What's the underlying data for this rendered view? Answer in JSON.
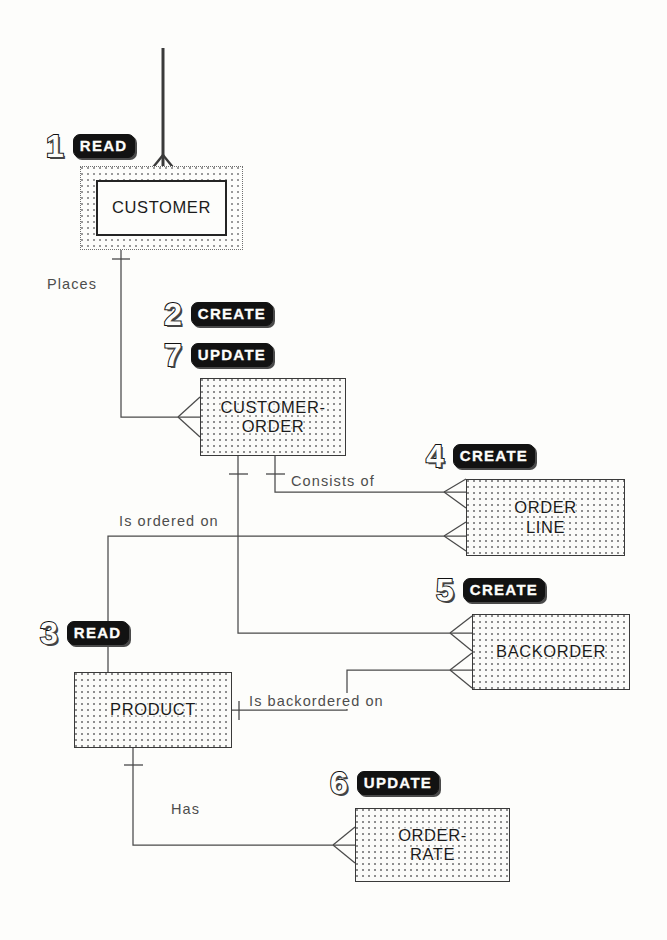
{
  "diagram": {
    "entities": [
      {
        "id": "customer",
        "label": "CUSTOMER",
        "x": 96,
        "y": 180,
        "w": 131,
        "h": 56
      },
      {
        "id": "customer-order",
        "label": "CUSTOMER-\nORDER",
        "x": 200,
        "y": 378,
        "w": 146,
        "h": 78
      },
      {
        "id": "order-line",
        "label": "ORDER\nLINE",
        "x": 466,
        "y": 479,
        "w": 159,
        "h": 77
      },
      {
        "id": "backorder",
        "label": "BACKORDER",
        "x": 472,
        "y": 614,
        "w": 158,
        "h": 76
      },
      {
        "id": "product",
        "label": "PRODUCT",
        "x": 74,
        "y": 672,
        "w": 158,
        "h": 76
      },
      {
        "id": "order-rate",
        "label": "ORDER-\nRATE",
        "x": 355,
        "y": 808,
        "w": 155,
        "h": 74
      }
    ],
    "steps": [
      {
        "id": "step-1",
        "number": "1",
        "action": "READ",
        "x": 46,
        "y": 130
      },
      {
        "id": "step-2",
        "number": "2",
        "action": "CREATE",
        "x": 164,
        "y": 298
      },
      {
        "id": "step-7",
        "number": "7",
        "action": "UPDATE",
        "x": 164,
        "y": 339
      },
      {
        "id": "step-4",
        "number": "4",
        "action": "CREATE",
        "x": 426,
        "y": 440
      },
      {
        "id": "step-5",
        "number": "5",
        "action": "CREATE",
        "x": 436,
        "y": 574
      },
      {
        "id": "step-3",
        "number": "3",
        "action": "READ",
        "x": 40,
        "y": 617
      },
      {
        "id": "step-6",
        "number": "6",
        "action": "UPDATE",
        "x": 330,
        "y": 767
      }
    ],
    "relationships": [
      {
        "id": "rel-places",
        "label": "Places",
        "x": 44,
        "y": 276
      },
      {
        "id": "rel-consists-of",
        "label": "Consists of",
        "x": 288,
        "y": 473
      },
      {
        "id": "rel-is-ordered-on",
        "label": "Is ordered on",
        "x": 116,
        "y": 513
      },
      {
        "id": "rel-is-backordered",
        "label": "Is backordered on",
        "x": 246,
        "y": 693
      },
      {
        "id": "rel-has",
        "label": "Has",
        "x": 168,
        "y": 801
      }
    ],
    "colors": {
      "ink": "#242424",
      "line": "#4a4a4a",
      "paper": "#fdfdfb",
      "stipple": "#8e8e8e",
      "badge_fill": "#121212"
    }
  }
}
